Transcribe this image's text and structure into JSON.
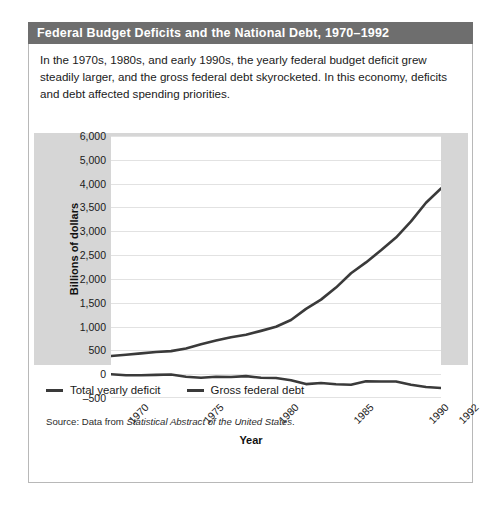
{
  "figure": {
    "title": "Federal Budget Deficits and the National Debt, 1970–1992",
    "caption": "In the 1970s, 1980s, and early 1990s, the yearly federal budget deficit grew steadily larger, and the gross federal debt skyrocketed. In this economy, deficits and debt affected spending priorities.",
    "source_prefix": "Source: Data from ",
    "source_italic": "Statistical Abstract of the United States",
    "source_suffix": "."
  },
  "colors": {
    "title_bar": "#6e6e6e",
    "title_text": "#ffffff",
    "panel_background": "#d6d6d6",
    "plot_background": "#ffffff",
    "gridline": "#e2e2e2",
    "series_line": "#3a3a3a",
    "card_border": "#b8b8b8"
  },
  "legend": {
    "position": "below-plot",
    "items": [
      {
        "label": "Total yearly deficit",
        "color": "#3a3a3a"
      },
      {
        "label": "Gross federal debt",
        "color": "#3a3a3a"
      }
    ]
  },
  "chart_data": {
    "type": "line",
    "title": "Federal Budget Deficits and the National Debt, 1970–1992",
    "xlabel": "Year",
    "ylabel": "Billions of dollars",
    "xlim": [
      1970,
      1992
    ],
    "ylim": [
      -500,
      6000
    ],
    "grid": true,
    "xticks": [
      1970,
      1975,
      1980,
      1985,
      1990,
      1992
    ],
    "xtick_labels": [
      "1970",
      "1975",
      "1980",
      "1985",
      "1990",
      "1992"
    ],
    "ytick_labels": [
      "6,000",
      "5,000",
      "4,000",
      "3,500",
      "3,000",
      "2,500",
      "2,000",
      "1,500",
      "1,000",
      "500",
      "0",
      "–500"
    ],
    "ytick_values": [
      6000,
      5000,
      4000,
      3500,
      3000,
      2500,
      2000,
      1500,
      1000,
      500,
      0,
      -500
    ],
    "x": [
      1970,
      1971,
      1972,
      1973,
      1974,
      1975,
      1976,
      1977,
      1978,
      1979,
      1980,
      1981,
      1982,
      1983,
      1984,
      1985,
      1986,
      1987,
      1988,
      1989,
      1990,
      1991,
      1992
    ],
    "series": [
      {
        "name": "Gross federal debt",
        "values": [
          380,
          408,
          436,
          466,
          484,
          541,
          629,
          706,
          777,
          829,
          909,
          995,
          1137,
          1371,
          1565,
          1818,
          2120,
          2346,
          2601,
          2868,
          3207,
          3598,
          3900
        ]
      },
      {
        "name": "Total yearly deficit",
        "values": [
          -3,
          -23,
          -23,
          -15,
          -6,
          -53,
          -74,
          -54,
          -59,
          -41,
          -74,
          -79,
          -128,
          -208,
          -185,
          -212,
          -221,
          -150,
          -155,
          -153,
          -221,
          -269,
          -290
        ]
      }
    ]
  }
}
